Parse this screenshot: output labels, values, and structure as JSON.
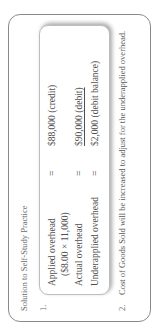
{
  "document": {
    "title": "Solution to Self-Study Practice",
    "item1": {
      "number": "1.",
      "rows": [
        {
          "label": "Applied overhead",
          "operator": "=",
          "value": "$88,000 (credit)"
        },
        {
          "label": "($8.00 × 11,000)"
        },
        {
          "label": "Actual overhead",
          "operator": "=",
          "value": "$90,000 (debit)"
        },
        {
          "label": "Underapplied overhead",
          "operator": "=",
          "value": "$2,000 (debit balance)"
        }
      ]
    },
    "item2": {
      "number": "2.",
      "text": "Cost of Goods Sold will be increased to adjust for the underapplied overhead."
    }
  },
  "colors": {
    "text": "#555555",
    "border": "#8a8a8a",
    "inner_border": "#bdbdbd",
    "background": "#ffffff"
  }
}
